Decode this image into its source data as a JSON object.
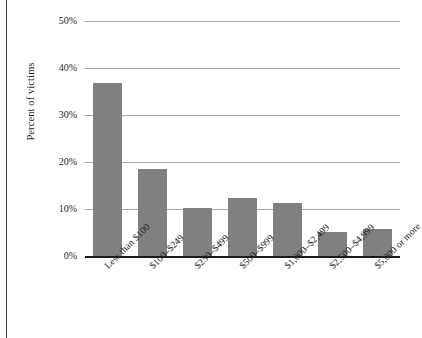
{
  "chart_data": {
    "type": "bar",
    "title": "",
    "subtitle": "",
    "xlabel": "",
    "ylabel": "Percent of victims",
    "ylim": [
      0,
      50
    ],
    "ytick_values": [
      0,
      10,
      20,
      30,
      40,
      50
    ],
    "ytick_labels": [
      "0%",
      "10%",
      "20%",
      "30%",
      "40%",
      "50%"
    ],
    "grid": true,
    "legend": null,
    "legend_position": "none",
    "bar_color": "#808080",
    "gridline_color": "#a8a8a8",
    "axis_color": "#1a1a1a",
    "categories": [
      "Less than $100",
      "$100–$249",
      "$250–$499",
      "$500–$999",
      "$1,000–$2,499",
      "$2,500–$4,999",
      "$5,000 or more"
    ],
    "values": [
      36.8,
      18.5,
      10.2,
      12.3,
      11.3,
      5.0,
      5.8
    ],
    "value_unit": "%"
  }
}
